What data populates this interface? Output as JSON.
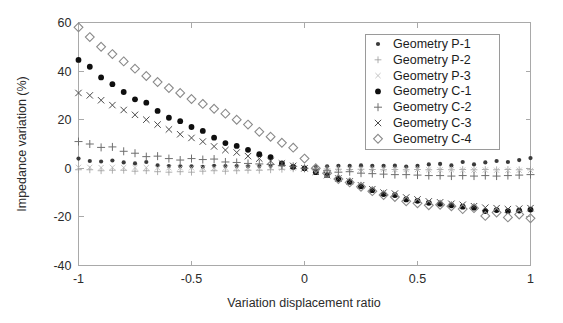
{
  "chart_data": {
    "type": "scatter",
    "title": "",
    "xlabel": "Variation displacement ratio",
    "ylabel": "Impedance variation (%)",
    "xlim": [
      -1,
      1
    ],
    "ylim": [
      -40,
      60
    ],
    "xticks": [
      -1,
      -0.5,
      0,
      0.5,
      1
    ],
    "xtick_labels": [
      "-1",
      "-0.5",
      "0",
      "0.5",
      "1"
    ],
    "yticks": [
      -40,
      -20,
      0,
      20,
      40,
      60
    ],
    "ytick_labels": [
      "-40",
      "-20",
      "0",
      "20",
      "40",
      "60"
    ],
    "grid": false,
    "legend_position": "upper right",
    "x": [
      -1,
      -0.95,
      -0.9,
      -0.85,
      -0.8,
      -0.75,
      -0.7,
      -0.65,
      -0.6,
      -0.55,
      -0.5,
      -0.45,
      -0.4,
      -0.35,
      -0.3,
      -0.25,
      -0.2,
      -0.15,
      -0.1,
      -0.05,
      0,
      0.05,
      0.1,
      0.15,
      0.2,
      0.25,
      0.3,
      0.35,
      0.4,
      0.45,
      0.5,
      0.55,
      0.6,
      0.65,
      0.7,
      0.75,
      0.8,
      0.85,
      0.9,
      0.95,
      1
    ],
    "series": [
      {
        "name": "Geometry P-1",
        "marker": "dot-small",
        "color": "#3a3a3a",
        "values": [
          4.0,
          3.0,
          2.8,
          3.2,
          2.4,
          2.0,
          2.6,
          1.2,
          0.9,
          0.8,
          0.8,
          0.6,
          1.0,
          0.9,
          0.9,
          0.8,
          0.9,
          1.0,
          1.6,
          0.5,
          0.0,
          0.6,
          0.8,
          1.0,
          1.0,
          1.2,
          1.0,
          1.0,
          1.1,
          0.7,
          1.0,
          1.6,
          1.8,
          1.2,
          2.6,
          1.6,
          2.4,
          3.0,
          2.6,
          3.4,
          4.2
        ]
      },
      {
        "name": "Geometry P-2",
        "marker": "plus-light",
        "color": "#9a9a9a",
        "values": [
          -0.6,
          -0.6,
          -1.0,
          -0.8,
          -0.8,
          -1.2,
          -1.0,
          -1.4,
          -1.6,
          -1.4,
          -1.6,
          -1.2,
          -1.0,
          -1.2,
          -1.0,
          -0.8,
          -0.8,
          -0.6,
          -0.4,
          -0.2,
          0.0,
          -0.2,
          -0.3,
          -0.4,
          -0.5,
          -0.4,
          -0.5,
          -0.6,
          -0.5,
          -0.6,
          -0.5,
          -0.6,
          -0.5,
          -0.6,
          -0.5,
          -0.6,
          -0.5,
          -0.6,
          -0.5,
          -0.6,
          -0.6
        ]
      },
      {
        "name": "Geometry P-3",
        "marker": "x-light",
        "color": "#b5b5b5",
        "values": [
          0.4,
          0.4,
          0.3,
          0.4,
          0.3,
          0.3,
          0.3,
          0.2,
          0.2,
          0.2,
          0.2,
          0.2,
          0.2,
          0.2,
          0.2,
          0.2,
          0.2,
          0.2,
          0.1,
          0.1,
          0.0,
          -0.1,
          -0.2,
          -0.2,
          -0.3,
          -0.3,
          -0.4,
          -0.4,
          -0.5,
          -0.5,
          -0.5,
          -0.6,
          -0.6,
          -0.6,
          -0.7,
          -0.7,
          -0.7,
          -0.8,
          -0.8,
          -0.8,
          -0.9
        ]
      },
      {
        "name": "Geometry C-1",
        "marker": "dot-filled",
        "color": "#0f0f0f",
        "values": [
          44.6,
          41.8,
          37.4,
          34.6,
          31.4,
          28.4,
          27.0,
          23.6,
          20.8,
          19.4,
          17.0,
          15.4,
          12.6,
          10.4,
          9.2,
          7.6,
          5.8,
          4.6,
          2.0,
          0.6,
          0.0,
          -1.6,
          -2.8,
          -4.4,
          -5.6,
          -7.4,
          -9.0,
          -10.6,
          -11.0,
          -12.8,
          -13.4,
          -14.2,
          -14.6,
          -15.2,
          -15.8,
          -16.2,
          -17.6,
          -17.2,
          -17.6,
          -17.4,
          -17.0
        ]
      },
      {
        "name": "Geometry C-2",
        "marker": "plus-dark",
        "color": "#6e6e6e",
        "values": [
          11.0,
          10.0,
          8.6,
          8.8,
          7.0,
          6.2,
          4.8,
          5.0,
          4.0,
          3.4,
          4.0,
          3.6,
          3.8,
          2.6,
          2.4,
          2.0,
          1.8,
          1.6,
          1.2,
          0.8,
          0.0,
          -0.6,
          -1.0,
          -1.6,
          -1.4,
          -2.0,
          -2.2,
          -2.4,
          -2.6,
          -2.6,
          -2.8,
          -3.0,
          -3.0,
          -3.2,
          -3.0,
          -3.2,
          -3.0,
          -3.2,
          -3.0,
          -2.8,
          -2.6
        ]
      },
      {
        "name": "Geometry C-3",
        "marker": "x-dark",
        "color": "#4a4a4a",
        "values": [
          31.0,
          30.0,
          28.0,
          26.0,
          24.0,
          22.0,
          20.0,
          18.0,
          16.0,
          14.0,
          12.5,
          11.0,
          9.0,
          7.5,
          6.5,
          5.0,
          4.0,
          3.0,
          2.0,
          1.0,
          0.0,
          -1.4,
          -2.8,
          -4.2,
          -5.4,
          -7.0,
          -8.6,
          -10.0,
          -10.4,
          -12.0,
          -12.8,
          -13.6,
          -14.0,
          -14.6,
          -15.0,
          -15.6,
          -16.2,
          -16.4,
          -16.8,
          -16.6,
          -16.4
        ]
      },
      {
        "name": "Geometry C-4",
        "marker": "diamond",
        "color": "#8a8a8a",
        "values": [
          58.0,
          54.0,
          50.0,
          47.0,
          44.0,
          41.0,
          38.0,
          35.5,
          33.0,
          31.0,
          28.5,
          26.5,
          24.5,
          22.5,
          20.0,
          18.0,
          15.0,
          13.0,
          10.5,
          8.5,
          4.0,
          0.0,
          -2.0,
          -4.4,
          -5.8,
          -7.6,
          -9.4,
          -11.0,
          -11.8,
          -13.6,
          -14.4,
          -15.2,
          -15.0,
          -15.6,
          -16.8,
          -16.4,
          -19.6,
          -18.2,
          -20.2,
          -19.0,
          -20.6
        ]
      }
    ]
  },
  "legend": {
    "entries": [
      "Geometry P-1",
      "Geometry P-2",
      "Geometry P-3",
      "Geometry C-1",
      "Geometry C-2",
      "Geometry C-3",
      "Geometry C-4"
    ]
  }
}
